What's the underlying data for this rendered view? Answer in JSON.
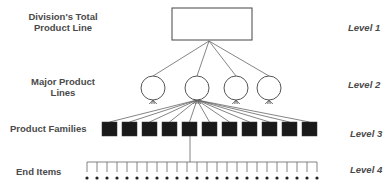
{
  "labels": {
    "l1": "Division's Total Product Line",
    "l1_a": "Division's Total",
    "l1_b": "Product Line",
    "l2_a": "Major Product",
    "l2_b": "Lines",
    "l3": "Product Families",
    "l4": "End Items"
  },
  "levels": [
    "Level 1",
    "Level 2",
    "Level 3",
    "Level 4"
  ],
  "diagram": {
    "root_box": {
      "x": 172,
      "y": 8,
      "w": 80,
      "h": 32
    },
    "major_lines_count": 4,
    "product_families_count": 11,
    "end_items_count": 24,
    "colors": {
      "stroke": "#555555",
      "fill_family": "#1a1a1a",
      "text": "#4a4a4a"
    }
  }
}
